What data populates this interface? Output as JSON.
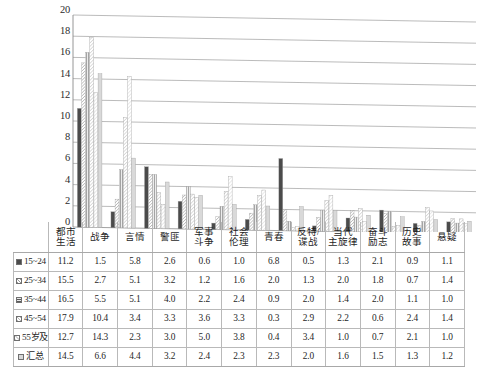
{
  "chart_data": {
    "type": "bar",
    "title": "",
    "subtitle": "",
    "xlabel": "",
    "ylabel": "",
    "ylim": [
      0,
      20
    ],
    "ytick_step": 2,
    "yticks": [
      "0",
      "2",
      "4",
      "6",
      "8",
      "10",
      "12",
      "14",
      "16",
      "18",
      "20"
    ],
    "grid": true,
    "legend_position": "table-row-labels",
    "categories": [
      "都市生活",
      "战争",
      "言情",
      "警匪",
      "军事斗争",
      "社会伦理",
      "青春",
      "反特/谍战",
      "当代主旋律",
      "奋斗励志",
      "历史故事",
      "悬疑"
    ],
    "categories_wrapped": [
      [
        "都市",
        "生活"
      ],
      [
        "战争",
        ""
      ],
      [
        "言情",
        ""
      ],
      [
        "警匪",
        ""
      ],
      [
        "军事",
        "斗争"
      ],
      [
        "社会",
        "伦理"
      ],
      [
        "青春",
        ""
      ],
      [
        "反特/",
        "谍战"
      ],
      [
        "当代",
        "主旋律"
      ],
      [
        "奋斗",
        "励志"
      ],
      [
        "历史",
        "故事"
      ],
      [
        "悬疑",
        ""
      ]
    ],
    "series": [
      {
        "name": "15~24",
        "color": "#4b4b4b",
        "pattern": "solid-dark",
        "values": [
          11.2,
          1.5,
          5.8,
          2.6,
          0.6,
          1.0,
          6.8,
          0.5,
          1.3,
          2.1,
          0.9,
          1.1
        ]
      },
      {
        "name": "25~34",
        "color": "#9a9a9a",
        "pattern": "diagonal-hatch",
        "values": [
          15.5,
          2.7,
          5.1,
          3.2,
          1.2,
          1.6,
          2.0,
          1.3,
          2.0,
          1.8,
          0.7,
          1.4
        ]
      },
      {
        "name": "35~44",
        "color": "#5a5a5a",
        "pattern": "horizontal-dots",
        "values": [
          16.5,
          5.5,
          5.1,
          4.0,
          2.2,
          2.4,
          0.9,
          2.0,
          1.4,
          2.0,
          1.1,
          1.0
        ]
      },
      {
        "name": "45~54",
        "color": "#b9b9b9",
        "pattern": "light-diagonal-hatch",
        "values": [
          17.9,
          10.4,
          3.4,
          3.3,
          3.6,
          3.3,
          0.3,
          2.9,
          2.2,
          0.6,
          2.4,
          1.4
        ]
      },
      {
        "name": "55岁及以上",
        "color": "#d2d2d2",
        "pattern": "faint-diagonal-hatch",
        "values": [
          12.7,
          14.3,
          2.3,
          3.0,
          5.0,
          3.8,
          0.4,
          3.4,
          1.0,
          0.7,
          2.1,
          1.0
        ]
      },
      {
        "name": "汇总",
        "color": "#d8d8d8",
        "pattern": "solid-light",
        "values": [
          14.5,
          6.6,
          4.4,
          3.2,
          2.4,
          2.3,
          2.3,
          2.0,
          1.6,
          1.5,
          1.3,
          1.2
        ]
      }
    ]
  },
  "table": {
    "corner_label": "",
    "column_headers": [
      {
        "l1": "都市",
        "l2": "生活"
      },
      {
        "l1": "战争",
        "l2": ""
      },
      {
        "l1": "言情",
        "l2": ""
      },
      {
        "l1": "警匪",
        "l2": ""
      },
      {
        "l1": "军事",
        "l2": "斗争"
      },
      {
        "l1": "社会",
        "l2": "伦理"
      },
      {
        "l1": "青春",
        "l2": ""
      },
      {
        "l1": "反特/",
        "l2": "谍战"
      },
      {
        "l1": "当代",
        "l2": "主旋律"
      },
      {
        "l1": "奋斗",
        "l2": "励志"
      },
      {
        "l1": "历史",
        "l2": "故事"
      },
      {
        "l1": "悬疑",
        "l2": ""
      }
    ],
    "rows": [
      {
        "label": "15~24",
        "values": [
          "11.2",
          "1.5",
          "5.8",
          "2.6",
          "0.6",
          "1.0",
          "6.8",
          "0.5",
          "1.3",
          "2.1",
          "0.9",
          "1.1"
        ]
      },
      {
        "label": "25~34",
        "values": [
          "15.5",
          "2.7",
          "5.1",
          "3.2",
          "1.2",
          "1.6",
          "2.0",
          "1.3",
          "2.0",
          "1.8",
          "0.7",
          "1.4"
        ]
      },
      {
        "label": "35~44",
        "values": [
          "16.5",
          "5.5",
          "5.1",
          "4.0",
          "2.2",
          "2.4",
          "0.9",
          "2.0",
          "1.4",
          "2.0",
          "1.1",
          "1.0"
        ]
      },
      {
        "label": "45~54",
        "values": [
          "17.9",
          "10.4",
          "3.4",
          "3.3",
          "3.6",
          "3.3",
          "0.3",
          "2.9",
          "2.2",
          "0.6",
          "2.4",
          "1.4"
        ]
      },
      {
        "label": "55岁及以上",
        "values": [
          "12.7",
          "14.3",
          "2.3",
          "3.0",
          "5.0",
          "3.8",
          "0.4",
          "3.4",
          "1.0",
          "0.7",
          "2.1",
          "1.0"
        ]
      },
      {
        "label": "汇总",
        "values": [
          "14.5",
          "6.6",
          "4.4",
          "3.2",
          "2.4",
          "2.3",
          "2.3",
          "2.0",
          "1.6",
          "1.5",
          "1.3",
          "1.2"
        ]
      }
    ]
  }
}
